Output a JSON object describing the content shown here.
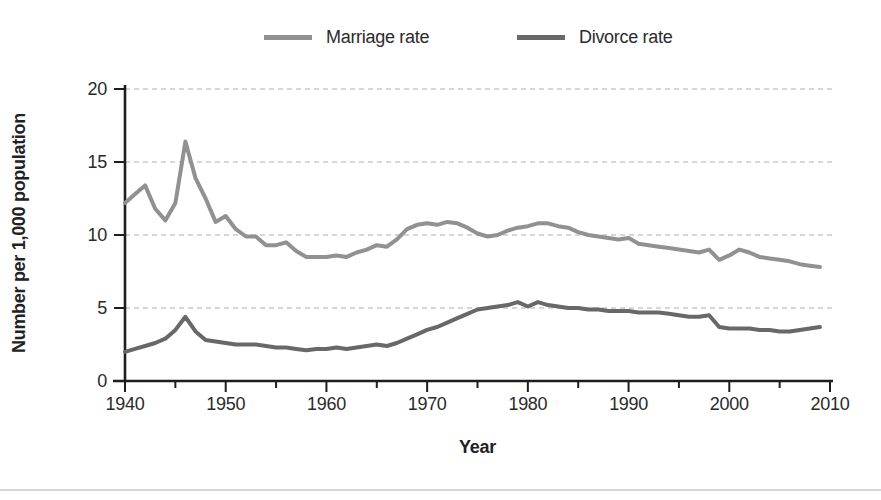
{
  "chart_data": {
    "type": "line",
    "title": "",
    "xlabel": "Year",
    "ylabel": "Number per 1,000 population",
    "xlim": [
      1940,
      2010
    ],
    "ylim": [
      0,
      20
    ],
    "x_major_ticks": [
      1940,
      1950,
      1960,
      1970,
      1980,
      1990,
      2000,
      2010
    ],
    "x_minor_ticks": [
      1945,
      1955,
      1965,
      1975,
      1985,
      1995,
      2005
    ],
    "y_ticks": [
      0,
      5,
      10,
      15,
      20
    ],
    "grid": "horizontal dashed gridlines at y ticks above 0",
    "legend_position": "top",
    "x_start": 1940,
    "x_step": 1,
    "series": [
      {
        "name": "Marriage rate",
        "color": "#919191",
        "values": [
          12.2,
          12.8,
          13.4,
          11.8,
          11.0,
          12.2,
          16.4,
          13.9,
          12.5,
          10.9,
          11.3,
          10.4,
          9.9,
          9.9,
          9.3,
          9.3,
          9.5,
          8.9,
          8.5,
          8.5,
          8.5,
          8.6,
          8.5,
          8.8,
          9.0,
          9.3,
          9.2,
          9.7,
          10.4,
          10.7,
          10.8,
          10.7,
          10.9,
          10.8,
          10.5,
          10.1,
          9.9,
          10.0,
          10.3,
          10.5,
          10.6,
          10.8,
          10.8,
          10.6,
          10.5,
          10.2,
          10.0,
          9.9,
          9.8,
          9.7,
          9.8,
          9.4,
          9.3,
          9.2,
          9.1,
          9.0,
          8.9,
          8.8,
          9.0,
          8.3,
          8.6,
          9.0,
          8.8,
          8.5,
          8.4,
          8.3,
          8.2,
          8.0,
          7.9,
          7.8
        ]
      },
      {
        "name": "Divorce rate",
        "color": "#686868",
        "values": [
          2.0,
          2.2,
          2.4,
          2.6,
          2.9,
          3.5,
          4.4,
          3.4,
          2.8,
          2.7,
          2.6,
          2.5,
          2.5,
          2.5,
          2.4,
          2.3,
          2.3,
          2.2,
          2.1,
          2.2,
          2.2,
          2.3,
          2.2,
          2.3,
          2.4,
          2.5,
          2.4,
          2.6,
          2.9,
          3.2,
          3.5,
          3.7,
          4.0,
          4.3,
          4.6,
          4.9,
          5.0,
          5.1,
          5.2,
          5.4,
          5.1,
          5.4,
          5.2,
          5.1,
          5.0,
          5.0,
          4.9,
          4.9,
          4.8,
          4.8,
          4.8,
          4.7,
          4.7,
          4.7,
          4.6,
          4.5,
          4.4,
          4.4,
          4.5,
          3.7,
          3.6,
          3.6,
          3.6,
          3.5,
          3.5,
          3.4,
          3.4,
          3.5,
          3.6,
          3.7
        ]
      }
    ]
  }
}
